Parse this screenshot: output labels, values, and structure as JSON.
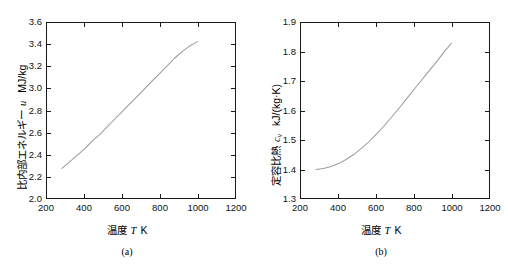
{
  "figure": {
    "panels": [
      {
        "caption": "(a)",
        "x_axis": {
          "title_jp": "温度",
          "symbol": "T",
          "unit": "K"
        },
        "y_axis": {
          "title_jp": "比内部エネルギー",
          "symbol": "u",
          "unit": "MJ/kg"
        }
      },
      {
        "caption": "(b)",
        "x_axis": {
          "title_jp": "温度",
          "symbol": "T",
          "unit": "K"
        },
        "y_axis": {
          "title_jp": "定容比熱",
          "symbol": "c",
          "subscript": "v",
          "unit": "kJ/(kg·K)"
        }
      }
    ]
  },
  "chart_data": [
    {
      "type": "line",
      "title": "",
      "panel_label": "(a)",
      "xlabel": "温度 T  K",
      "ylabel": "比内部エネルギー u  MJ/kg",
      "xlim": [
        200,
        1200
      ],
      "ylim": [
        2.0,
        3.6
      ],
      "xticks": [
        200,
        400,
        600,
        800,
        1000,
        1200
      ],
      "yticks": [
        2.0,
        2.2,
        2.4,
        2.6,
        2.8,
        3.0,
        3.2,
        3.4,
        3.6
      ],
      "xtick_labels": [
        "200",
        "400",
        "600",
        "800",
        "1000",
        "1200"
      ],
      "ytick_labels": [
        "2.0",
        "2.2",
        "2.4",
        "2.6",
        "2.8",
        "3.0",
        "3.2",
        "3.4",
        "3.6"
      ],
      "grid": false,
      "legend": null,
      "line_color": "#9a9a9a",
      "x": [
        280,
        320,
        360,
        400,
        440,
        480,
        520,
        560,
        600,
        640,
        680,
        720,
        760,
        800,
        840,
        880,
        920,
        960,
        1000
      ],
      "values": [
        2.27,
        2.33,
        2.39,
        2.45,
        2.52,
        2.58,
        2.65,
        2.72,
        2.79,
        2.86,
        2.93,
        3.0,
        3.07,
        3.14,
        3.21,
        3.28,
        3.34,
        3.39,
        3.43
      ]
    },
    {
      "type": "line",
      "title": "",
      "panel_label": "(b)",
      "xlabel": "温度 T  K",
      "ylabel": "定容比熱 cv  kJ/(kg·K)",
      "xlim": [
        200,
        1200
      ],
      "ylim": [
        1.3,
        1.9
      ],
      "xticks": [
        200,
        400,
        600,
        800,
        1000,
        1200
      ],
      "yticks": [
        1.3,
        1.4,
        1.5,
        1.6,
        1.7,
        1.8,
        1.9
      ],
      "xtick_labels": [
        "200",
        "400",
        "600",
        "800",
        "1000",
        "1200"
      ],
      "ytick_labels": [
        "1.3",
        "1.4",
        "1.5",
        "1.6",
        "1.7",
        "1.8",
        "1.9"
      ],
      "grid": false,
      "legend": null,
      "line_color": "#9a9a9a",
      "x": [
        280,
        320,
        360,
        400,
        440,
        480,
        520,
        560,
        600,
        640,
        680,
        720,
        760,
        800,
        840,
        880,
        920,
        960,
        1000
      ],
      "values": [
        1.398,
        1.401,
        1.408,
        1.418,
        1.432,
        1.449,
        1.469,
        1.492,
        1.518,
        1.546,
        1.576,
        1.607,
        1.639,
        1.671,
        1.703,
        1.735,
        1.766,
        1.8,
        1.83
      ]
    }
  ]
}
